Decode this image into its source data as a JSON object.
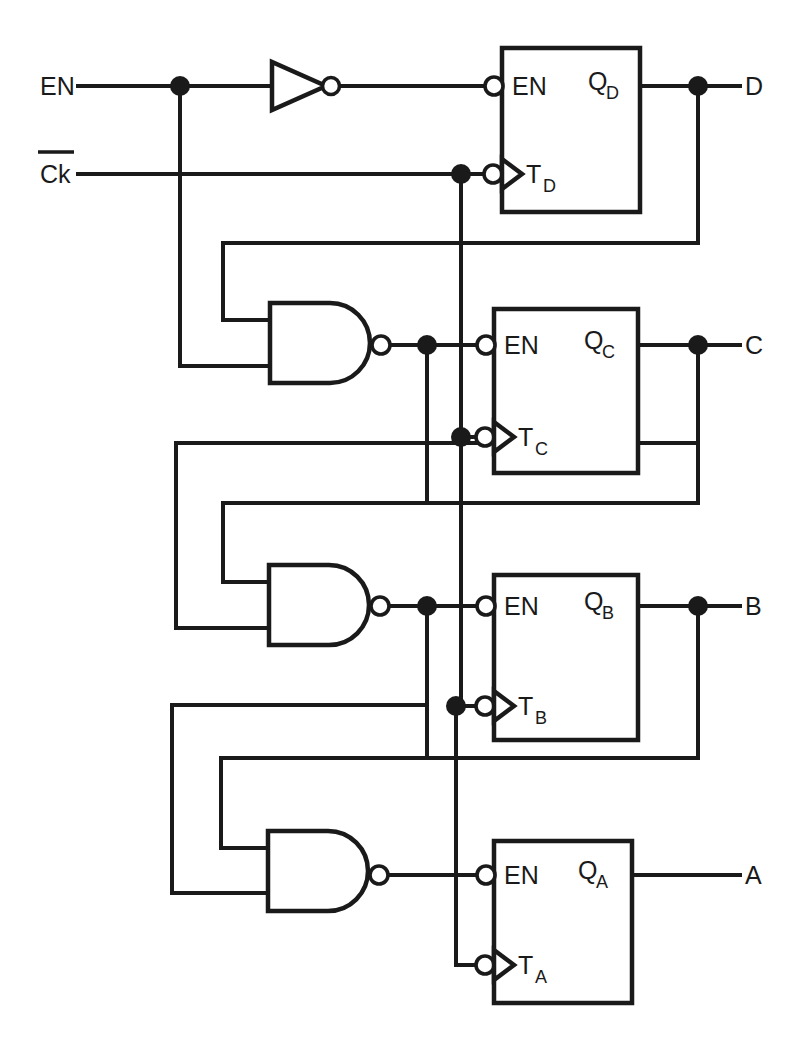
{
  "diagram": {
    "type": "logic-circuit-schematic",
    "background_color": "#ffffff",
    "line_color": "#1a1a1a"
  },
  "inputs": [
    {
      "id": "en",
      "label": "EN",
      "overbar": false,
      "y": 86
    },
    {
      "id": "ck",
      "label": "Ck",
      "overbar": true,
      "y": 174
    }
  ],
  "outputs": [
    {
      "id": "d",
      "label": "D",
      "y": 86,
      "has_junction": true
    },
    {
      "id": "c",
      "label": "C",
      "y": 345,
      "has_junction": true
    },
    {
      "id": "b",
      "label": "B",
      "y": 606,
      "has_junction": true
    },
    {
      "id": "a",
      "label": "A",
      "y": 875,
      "has_junction": false
    }
  ],
  "flipflops": [
    {
      "id": "ffd",
      "q_label": "Q",
      "q_sub": "D",
      "t_label": "T",
      "t_sub": "D",
      "en_label": "EN",
      "x": 502,
      "y": 48,
      "w": 138,
      "h": 164,
      "en_y": 86,
      "t_y": 174
    },
    {
      "id": "ffc",
      "q_label": "Q",
      "q_sub": "C",
      "t_label": "T",
      "t_sub": "C",
      "en_label": "EN",
      "x": 494,
      "y": 309,
      "w": 144,
      "h": 164,
      "en_y": 345,
      "t_y": 437
    },
    {
      "id": "ffb",
      "q_label": "Q",
      "q_sub": "B",
      "t_label": "T",
      "t_sub": "B",
      "en_label": "EN",
      "x": 494,
      "y": 575,
      "w": 144,
      "h": 165,
      "en_y": 606,
      "t_y": 706
    },
    {
      "id": "ffa",
      "q_label": "Q",
      "q_sub": "A",
      "t_label": "T",
      "t_sub": "A",
      "en_label": "EN",
      "x": 494,
      "y": 841,
      "w": 138,
      "h": 162,
      "en_y": 875,
      "t_y": 965
    }
  ],
  "gates": [
    {
      "id": "inv",
      "kind": "inverter",
      "x": 272,
      "y": 62,
      "w": 54,
      "h": 48
    },
    {
      "id": "nandc",
      "kind": "nand",
      "x": 270,
      "y": 303,
      "w": 110,
      "h": 80,
      "in_a_y": 320,
      "in_b_y": 366,
      "out_y": 345
    },
    {
      "id": "nandb",
      "kind": "nand",
      "x": 269,
      "y": 565,
      "w": 110,
      "h": 80,
      "in_a_y": 582,
      "in_b_y": 628,
      "out_y": 606
    },
    {
      "id": "nanda",
      "kind": "nand",
      "x": 268,
      "y": 831,
      "w": 110,
      "h": 80,
      "in_a_y": 848,
      "in_b_y": 893,
      "out_y": 875
    }
  ],
  "junction_dots": [
    {
      "id": "dot-en-branch",
      "x": 180,
      "y": 86
    },
    {
      "id": "dot-ck-td",
      "x": 461,
      "y": 174
    },
    {
      "id": "dot-qd-out",
      "x": 698,
      "y": 86
    },
    {
      "id": "dot-nandc-out",
      "x": 427,
      "y": 345
    },
    {
      "id": "dot-ck-tc",
      "x": 461,
      "y": 437
    },
    {
      "id": "dot-qc-out",
      "x": 698,
      "y": 345
    },
    {
      "id": "dot-nandb-out",
      "x": 427,
      "y": 606
    },
    {
      "id": "dot-ck-tb",
      "x": 456,
      "y": 706
    },
    {
      "id": "dot-qb-out",
      "x": 698,
      "y": 606
    }
  ],
  "nets": {
    "en_bus_x": 180,
    "clock_bus_x_top": 461,
    "clock_bus_x_bottom": 456,
    "feedback_bus_x": [
      176,
      223,
      270
    ],
    "output_tap_x": 698,
    "output_label_x": 745
  },
  "icon_names": {
    "inverter": "inverter-gate-icon",
    "nand": "nand-gate-icon",
    "bubble": "inversion-bubble-icon",
    "clock_wedge": "clock-edge-triangle-icon",
    "junction": "junction-dot-icon"
  }
}
